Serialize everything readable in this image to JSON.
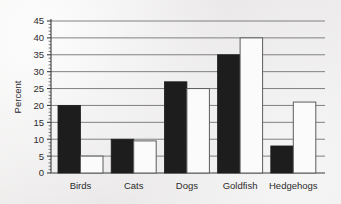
{
  "chart_data": {
    "type": "bar",
    "title": "",
    "subtitle": "",
    "xlabel": "",
    "ylabel": "Percent",
    "categories": [
      "Birds",
      "Cats",
      "Dogs",
      "Goldfish",
      "Hedgehogs"
    ],
    "series": [
      {
        "name": "series-1-dark",
        "color": "#1d1d1d",
        "values": [
          20,
          10,
          27,
          35,
          8
        ]
      },
      {
        "name": "series-2-light",
        "color": "#ffffff",
        "values": [
          5,
          9.5,
          25,
          40,
          21
        ]
      }
    ],
    "ylim": [
      0,
      45
    ],
    "ytick_values": [
      0,
      5,
      10,
      15,
      20,
      25,
      30,
      35,
      40,
      45
    ],
    "ytick_labels": [
      "0",
      "5",
      "10",
      "15",
      "20",
      "25",
      "30",
      "35",
      "40",
      "45"
    ],
    "minor_ticks_per_interval": 4,
    "grid": true,
    "grid_axis": "y",
    "legend": false,
    "legend_position": "none",
    "annotations": []
  },
  "figure": {
    "background_color": "#eceaea",
    "axis_color": "#3c3c3c",
    "grid_color": "#747474",
    "text_color": "#2b2b2b"
  }
}
